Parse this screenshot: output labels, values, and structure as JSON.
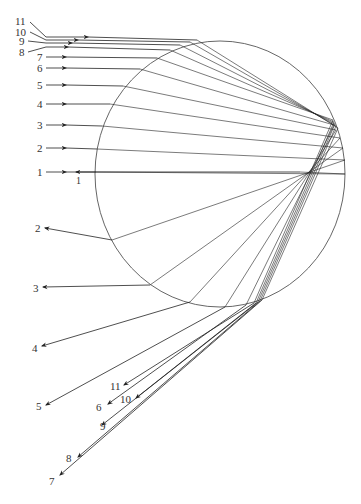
{
  "figure": {
    "type": "ray-tracing diagram of light rays in a spherical water droplet (rainbow formation)",
    "circle": {
      "cx": 220,
      "cy": 174,
      "rx": 125,
      "ry": 133,
      "stroke": "#555555"
    },
    "ray_color": "#222222",
    "incoming_rays": [
      {
        "id": "1",
        "y": 172,
        "label": "1"
      },
      {
        "id": "2",
        "y": 148,
        "label": "2"
      },
      {
        "id": "3",
        "y": 125,
        "label": "3"
      },
      {
        "id": "4",
        "y": 104,
        "label": "4"
      },
      {
        "id": "5",
        "y": 85,
        "label": "5"
      },
      {
        "id": "6",
        "y": 68,
        "label": "6"
      },
      {
        "id": "7",
        "y": 57,
        "label": "7"
      },
      {
        "id": "8",
        "y": 47,
        "label": "8"
      },
      {
        "id": "9",
        "y": 43,
        "label": "9"
      },
      {
        "id": "10",
        "y": 40,
        "label": "10"
      },
      {
        "id": "11",
        "y": 37,
        "label": "11"
      }
    ],
    "outgoing_rays": [
      {
        "id": "1",
        "label": "1"
      },
      {
        "id": "2",
        "label": "2"
      },
      {
        "id": "3",
        "label": "3"
      },
      {
        "id": "4",
        "label": "4"
      },
      {
        "id": "5",
        "label": "5"
      },
      {
        "id": "6",
        "label": "6"
      },
      {
        "id": "7",
        "label": "7"
      },
      {
        "id": "8",
        "label": "8"
      },
      {
        "id": "9",
        "label": "9"
      },
      {
        "id": "10",
        "label": "10"
      },
      {
        "id": "11",
        "label": "11"
      }
    ]
  }
}
